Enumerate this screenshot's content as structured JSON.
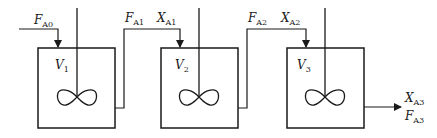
{
  "diagram": {
    "type": "cascade of stirred tank reactors (CSTRs in series)",
    "stroke_color": "#1a1a1a",
    "background": "#ffffff",
    "reactors": [
      {
        "id": "reactor-1",
        "volume_main": "V",
        "volume_sub": "1"
      },
      {
        "id": "reactor-2",
        "volume_main": "V",
        "volume_sub": "2"
      },
      {
        "id": "reactor-3",
        "volume_main": "V",
        "volume_sub": "3"
      }
    ],
    "streams": {
      "feed": {
        "main": "F",
        "sub": "A0"
      },
      "f1": {
        "main": "F",
        "sub": "A1"
      },
      "x1": {
        "main": "X",
        "sub": "A1"
      },
      "f2": {
        "main": "F",
        "sub": "A2"
      },
      "x2": {
        "main": "X",
        "sub": "A2"
      },
      "x3": {
        "main": "X",
        "sub": "A3"
      },
      "f3": {
        "main": "F",
        "sub": "A3"
      }
    }
  }
}
